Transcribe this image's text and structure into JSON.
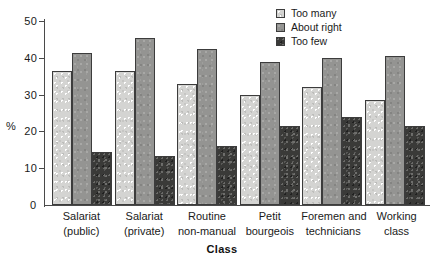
{
  "chart_data": {
    "type": "bar",
    "title": "",
    "xlabel": "Class",
    "ylabel": "%",
    "ylim": [
      0,
      50
    ],
    "yticks": [
      0,
      10,
      20,
      30,
      40,
      50
    ],
    "grid": false,
    "legend_position": "top-right",
    "categories": [
      [
        "Salariat",
        "(public)"
      ],
      [
        "Salariat",
        "(private)"
      ],
      [
        "Routine",
        "non-manual"
      ],
      [
        "Petit",
        "bourgeois"
      ],
      [
        "Foremen and",
        "technicians"
      ],
      [
        "Working",
        "class"
      ]
    ],
    "series": [
      {
        "name": "Too many",
        "color": "#d4d4d2",
        "values": [
          36.5,
          36.5,
          33.0,
          30.0,
          32.0,
          28.5
        ]
      },
      {
        "name": "About right",
        "color": "#949492",
        "values": [
          41.2,
          45.4,
          42.5,
          38.8,
          40.0,
          40.5
        ]
      },
      {
        "name": "Too few",
        "color": "#3a3a38",
        "values": [
          14.5,
          13.2,
          16.0,
          21.5,
          23.8,
          21.5
        ]
      }
    ]
  },
  "axis": {
    "y_title": "%",
    "x_title": "Class",
    "zero_label": "0",
    "tick_labels": [
      "10",
      "20",
      "30",
      "40",
      "50"
    ]
  },
  "legend": {
    "items": [
      {
        "label": "Too many"
      },
      {
        "label": "About right"
      },
      {
        "label": "Too few"
      }
    ]
  }
}
